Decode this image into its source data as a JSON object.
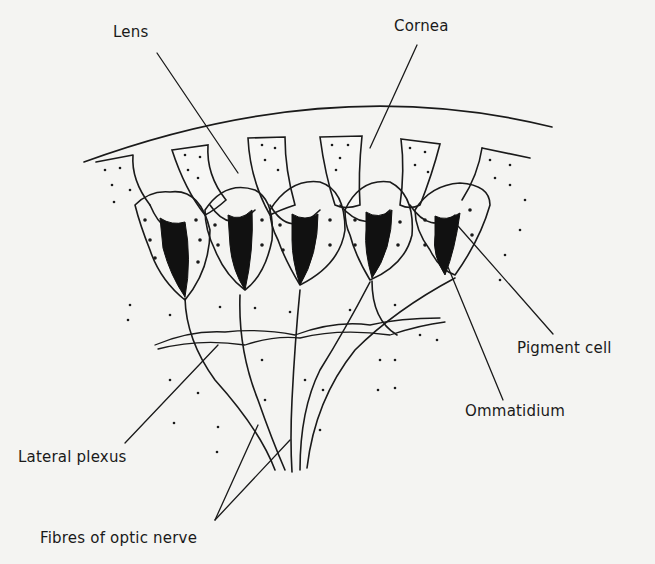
{
  "figure": {
    "colors": {
      "background": "#f4f4f2",
      "ink": "#1a1a1a",
      "pigment": "#111111"
    }
  },
  "labels": {
    "lens": "Lens",
    "cornea": "Cornea",
    "pigment_cell": "Pigment cell",
    "ommatidium": "Ommatidium",
    "lateral_plexus": "Lateral plexus",
    "fibres_optic_nerve": "Fibres of optic nerve"
  },
  "structure": {
    "ommatidia_count": 5,
    "lens_units_count": 6
  }
}
